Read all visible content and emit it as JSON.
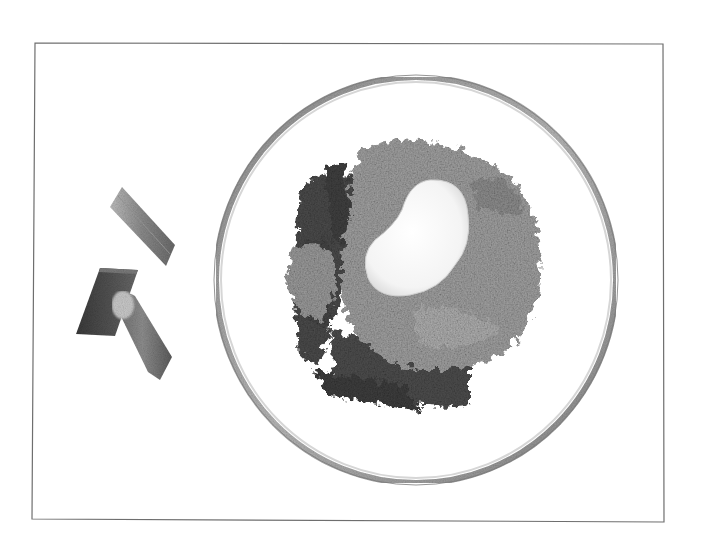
{
  "image": {
    "description": "Black and white photograph of a rhubarb crumble topped with a dollop of cream in a clear glass bowl, with three raw rhubarb stalk pieces beside it, enclosed in a thin rectangular frame",
    "colors": {
      "background": "#ffffff",
      "frame": "#6e6e6e",
      "bowl_rim": "#9a9a9a",
      "crumble": "#9c9c9c",
      "rhubarb_dark": "#4a4a4a",
      "cream": "#f7f7f7"
    },
    "elements": {
      "frame": "rectangular border",
      "bowl": "glass bowl",
      "crumble": "crumble topping",
      "cream": "cream dollop",
      "rhubarb_pieces": [
        "rhubarb piece top",
        "rhubarb piece dark",
        "rhubarb piece cut-end"
      ]
    }
  }
}
